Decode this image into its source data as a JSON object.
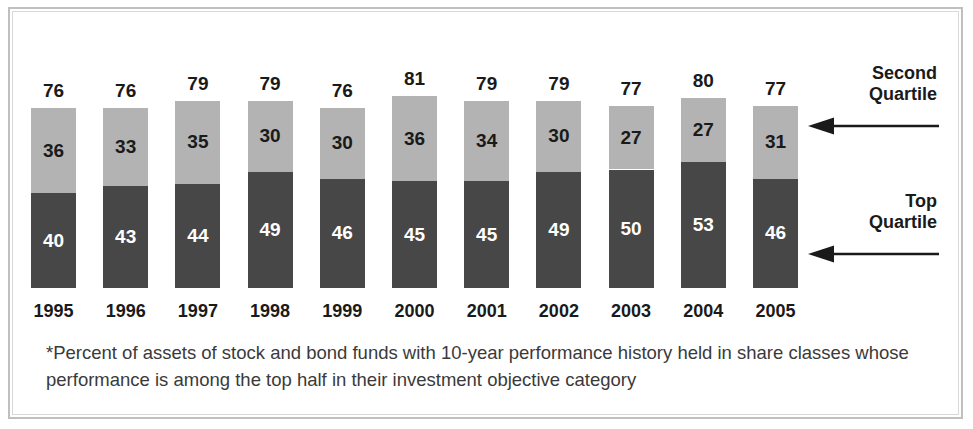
{
  "chart_data": {
    "type": "bar",
    "subtype": "stacked-bar",
    "title": "",
    "xlabel": "",
    "ylabel": "",
    "ylim": [
      0,
      90
    ],
    "grid": false,
    "legend_position": "right-inline-annotations",
    "categories": [
      "1995",
      "1996",
      "1997",
      "1998",
      "1999",
      "2000",
      "2001",
      "2002",
      "2003",
      "2004",
      "2005"
    ],
    "series": [
      {
        "name": "Top Quartile",
        "color": "#474747",
        "values": [
          40,
          43,
          44,
          49,
          46,
          45,
          45,
          49,
          50,
          53,
          46
        ]
      },
      {
        "name": "Second Quartile",
        "color": "#b3b3b3",
        "values": [
          36,
          33,
          35,
          30,
          30,
          36,
          34,
          30,
          27,
          27,
          31
        ]
      }
    ],
    "totals": [
      76,
      76,
      79,
      79,
      76,
      81,
      79,
      79,
      77,
      80,
      77
    ],
    "annotations": [
      {
        "label": "Second\nQuartile",
        "line1": "Second",
        "line2": "Quartile",
        "points_to": "second-quartile-segment"
      },
      {
        "label": "Top\nQuartile",
        "line1": "Top",
        "line2": "Quartile",
        "points_to": "top-quartile-segment"
      }
    ]
  },
  "annotations": {
    "second_quartile": {
      "line1": "Second",
      "line2": "Quartile"
    },
    "top_quartile": {
      "line1": "Top",
      "line2": "Quartile"
    }
  },
  "footnote": {
    "text": "*Percent of assets of stock and bond funds with 10-year performance history held in share classes whose performance is among the top half in their investment objective category"
  },
  "colors": {
    "top_quartile": "#474747",
    "second_quartile": "#b3b3b3",
    "text": "#1a1a1a",
    "footnote_text": "#3a3a3a",
    "frame": "#bfbfbf",
    "background": "#ffffff"
  }
}
